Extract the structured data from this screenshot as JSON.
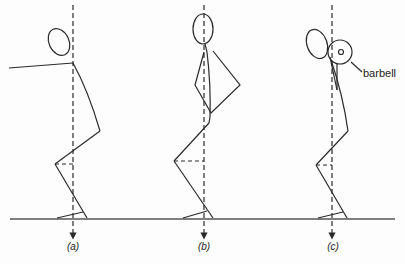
{
  "diagram": {
    "type": "biomechanics line drawing",
    "colors": {
      "line": "#2a2a2a",
      "background": "#fdfdfd"
    },
    "ground": {
      "y": 219,
      "x_start": 10,
      "x_end": 395
    },
    "figures": [
      {
        "id": "a",
        "caption": "(a)",
        "gravity_line_x": 73,
        "note": "arms extended forward"
      },
      {
        "id": "b",
        "caption": "(b)",
        "gravity_line_x": 204,
        "note": "arms folded in front of torso"
      },
      {
        "id": "c",
        "caption": "(c)",
        "gravity_line_x": 332,
        "note": "barbell held at shoulder"
      }
    ],
    "annotations": {
      "barbell_label": "barbell"
    }
  }
}
